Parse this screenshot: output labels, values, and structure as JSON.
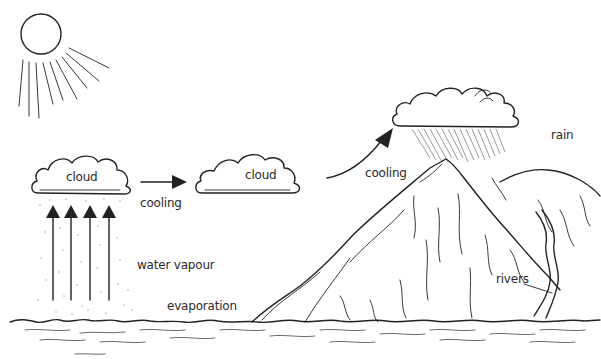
{
  "diagram": {
    "colors": {
      "ink": "#222222",
      "background": "#ffffff",
      "text": "#2a2a2a"
    },
    "elements": {
      "sun": {
        "icon": "sun-icon"
      },
      "cloud_left": {
        "label": "cloud"
      },
      "cloud_middle": {
        "label": "cloud"
      },
      "rain_cloud": {
        "icon": "rain-cloud-icon"
      },
      "mountain": {
        "icon": "mountain-icon"
      },
      "sea": {
        "icon": "sea-waves-icon"
      }
    },
    "labels": {
      "cloud_left": "cloud",
      "cloud_middle": "cloud",
      "cooling_1": "cooling",
      "cooling_2": "cooling",
      "rain": "rain",
      "water_vapour": "water vapour",
      "evaporation": "evaporation",
      "rivers": "rivers"
    },
    "arrows": [
      {
        "from": "sea",
        "to": "cloud_left",
        "label": "water vapour",
        "count": 4
      },
      {
        "from": "cloud_left",
        "to": "cloud_middle",
        "label": "cooling"
      },
      {
        "from": "cloud_middle",
        "to": "rain_cloud",
        "label": "cooling"
      }
    ]
  }
}
